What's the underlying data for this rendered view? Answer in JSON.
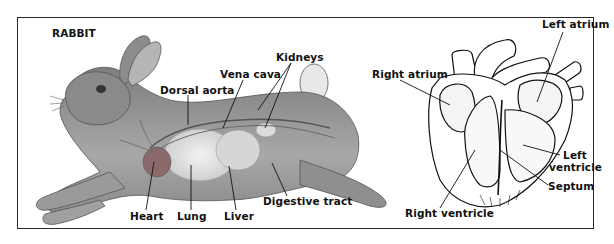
{
  "figure": {
    "title": "RABBIT",
    "rabbit_labels": {
      "kidneys": "Kidneys",
      "vena_cava": "Vena cava",
      "dorsal_aorta": "Dorsal aorta",
      "heart": "Heart",
      "lung": "Lung",
      "liver": "Liver",
      "digestive_tract": "Digestive tract"
    },
    "heart_labels": {
      "left_atrium": "Left atrium",
      "right_atrium": "Right atrium",
      "left_ventricle_line1": "Left",
      "left_ventricle_line2": "ventricle",
      "septum": "Septum",
      "right_ventricle": "Right ventricle"
    },
    "colors": {
      "frame": "#2a2a2a",
      "rabbit_body": "#9a9a9a",
      "rabbit_dark": "#5a5a5a",
      "organ_light": "#e6e6e6",
      "heart_red": "#8a6a6a",
      "line": "#111111"
    }
  }
}
